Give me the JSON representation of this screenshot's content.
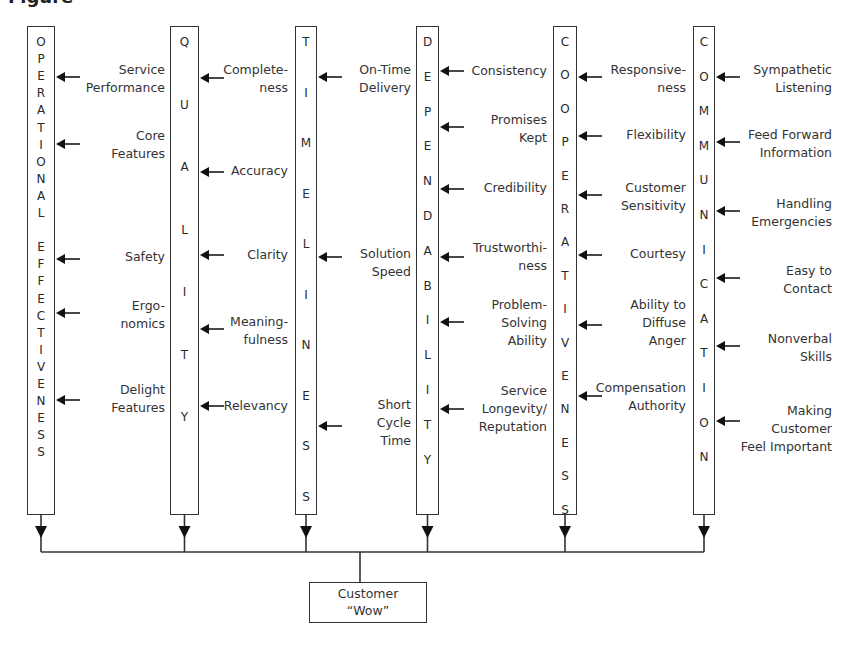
{
  "diagram": {
    "header_fragment": "Figure",
    "columns": [
      {
        "id": "operational-effectiveness",
        "title": "OPERATIONAL EFFECTIVENESS",
        "letters": [
          "O",
          "P",
          "E",
          "R",
          "A",
          "T",
          "I",
          "O",
          "N",
          "A",
          "L",
          "",
          "E",
          "F",
          "F",
          "E",
          "C",
          "T",
          "I",
          "V",
          "E",
          "N",
          "E",
          "S",
          "S"
        ],
        "box": {
          "x": 27,
          "y": 26,
          "w": 28,
          "h": 489
        },
        "letter_start_y": 34,
        "letter_step": 17.1,
        "factors": [
          {
            "label": "Service\nPerformance",
            "arrow_y": 77,
            "label_y": 61
          },
          {
            "label": "Core\nFeatures",
            "arrow_y": 144,
            "label_y": 127
          },
          {
            "label": "Safety",
            "arrow_y": 259,
            "label_y": 248
          },
          {
            "label": "Ergo-\nnomics",
            "arrow_y": 313,
            "label_y": 297
          },
          {
            "label": "Delight\nFeatures",
            "arrow_y": 400,
            "label_y": 381
          }
        ],
        "label_right": 165
      },
      {
        "id": "quality",
        "title": "QUALITY",
        "letters": [
          "Q",
          "U",
          "A",
          "L",
          "I",
          "T",
          "Y"
        ],
        "box": {
          "x": 170,
          "y": 26,
          "w": 29,
          "h": 489
        },
        "letter_start_y": 34,
        "letter_step": 62.5,
        "factors": [
          {
            "label": "Complete-\nness",
            "arrow_y": 78,
            "label_y": 61
          },
          {
            "label": "Accuracy",
            "arrow_y": 172,
            "label_y": 162
          },
          {
            "label": "Clarity",
            "arrow_y": 255,
            "label_y": 246
          },
          {
            "label": "Meaning-\nfulness",
            "arrow_y": 329,
            "label_y": 313
          },
          {
            "label": "Relevancy",
            "arrow_y": 406,
            "label_y": 397
          }
        ],
        "label_right": 288
      },
      {
        "id": "timeliness",
        "title": "TIMELINESS",
        "letters": [
          "T",
          "I",
          "M",
          "E",
          "L",
          "I",
          "N",
          "E",
          "S",
          "S"
        ],
        "box": {
          "x": 295,
          "y": 26,
          "w": 22,
          "h": 489
        },
        "letter_start_y": 34,
        "letter_step": 50.5,
        "factors": [
          {
            "label": "On-Time\nDelivery",
            "arrow_y": 77,
            "label_y": 61
          },
          {
            "label": "Solution\nSpeed",
            "arrow_y": 257,
            "label_y": 245
          },
          {
            "label": "Short\nCycle\nTime",
            "arrow_y": 426,
            "label_y": 396
          }
        ],
        "label_right": 411
      },
      {
        "id": "dependability",
        "title": "DEPENDABILITY",
        "letters": [
          "D",
          "E",
          "P",
          "E",
          "N",
          "D",
          "A",
          "B",
          "I",
          "L",
          "I",
          "T",
          "Y"
        ],
        "box": {
          "x": 416,
          "y": 26,
          "w": 23,
          "h": 489
        },
        "letter_start_y": 34,
        "letter_step": 34.8,
        "factors": [
          {
            "label": "Consistency",
            "arrow_y": 71,
            "label_y": 62
          },
          {
            "label": "Promises\nKept",
            "arrow_y": 127,
            "label_y": 111
          },
          {
            "label": "Credibility",
            "arrow_y": 189,
            "label_y": 179
          },
          {
            "label": "Trustworthi-\nness",
            "arrow_y": 257,
            "label_y": 239
          },
          {
            "label": "Problem-\nSolving\nAbility",
            "arrow_y": 322,
            "label_y": 296
          },
          {
            "label": "Service\nLongevity/\nReputation",
            "arrow_y": 409,
            "label_y": 382
          }
        ],
        "label_right": 547
      },
      {
        "id": "cooperativeness",
        "title": "COOPERATIVENESS",
        "letters": [
          "C",
          "O",
          "O",
          "P",
          "E",
          "R",
          "A",
          "T",
          "I",
          "V",
          "E",
          "N",
          "E",
          "S",
          "S"
        ],
        "box": {
          "x": 553,
          "y": 26,
          "w": 24,
          "h": 489
        },
        "letter_start_y": 34,
        "letter_step": 33.4,
        "factors": [
          {
            "label": "Responsive-\nness",
            "arrow_y": 77,
            "label_y": 61
          },
          {
            "label": "Flexibility",
            "arrow_y": 136,
            "label_y": 126
          },
          {
            "label": "Customer\nSensitivity",
            "arrow_y": 195,
            "label_y": 179
          },
          {
            "label": "Courtesy",
            "arrow_y": 255,
            "label_y": 245
          },
          {
            "label": "Ability to\nDiffuse\nAnger",
            "arrow_y": 325,
            "label_y": 296
          },
          {
            "label": "Compensation\nAuthority",
            "arrow_y": 396,
            "label_y": 379
          }
        ],
        "label_right": 686
      },
      {
        "id": "communication",
        "title": "COMMUNICATION",
        "letters": [
          "C",
          "O",
          "M",
          "M",
          "U",
          "N",
          "I",
          "C",
          "A",
          "T",
          "I",
          "O",
          "N"
        ],
        "box": {
          "x": 693,
          "y": 26,
          "w": 22,
          "h": 489
        },
        "letter_start_y": 34,
        "letter_step": 34.6,
        "factors": [
          {
            "label": "Sympathetic\nListening",
            "arrow_y": 77,
            "label_y": 61
          },
          {
            "label": "Feed Forward\nInformation",
            "arrow_y": 142,
            "label_y": 126
          },
          {
            "label": "Handling\nEmergencies",
            "arrow_y": 211,
            "label_y": 195
          },
          {
            "label": "Easy to\nContact",
            "arrow_y": 278,
            "label_y": 262
          },
          {
            "label": "Nonverbal\nSkills",
            "arrow_y": 346,
            "label_y": 330
          },
          {
            "label": "Making\nCustomer\nFeel Important",
            "arrow_y": 421,
            "label_y": 402
          }
        ],
        "label_right": 832
      }
    ],
    "bus": {
      "y": 552,
      "x_start": 41,
      "x_end": 704,
      "stem_x": 360,
      "arrow_tip_y": 538
    },
    "outcome": {
      "line1": "Customer",
      "line2": "“Wow”"
    }
  }
}
